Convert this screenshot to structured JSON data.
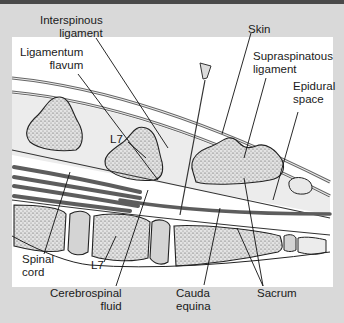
{
  "figure": {
    "type": "anatomical-diagram",
    "colors": {
      "background": "#d9d9d9",
      "panel": "#ffffff",
      "top_bar": "#4a4a4a",
      "bone_fill": "#e6e6e6",
      "bone_stipple": "#555555",
      "disc_fill": "#d4d4d4",
      "skin_band": "#eeeeee",
      "neural_line": "#5a5a5a",
      "leader_line": "#1a1a1a"
    }
  },
  "labels": {
    "interspinous_ligament": {
      "line1": "Interspinous",
      "line2": "ligament"
    },
    "ligamentum_flavum": {
      "line1": "Ligamentum",
      "line2": "flavum"
    },
    "skin": {
      "line1": "Skin"
    },
    "supraspinatous_ligament": {
      "line1": "Supraspinatous",
      "line2": "ligament"
    },
    "epidural_space": {
      "line1": "Epidural",
      "line2": "space"
    },
    "l7_upper": {
      "line1": "L7"
    },
    "l7_lower": {
      "line1": "L7"
    },
    "spinal_cord": {
      "line1": "Spinal",
      "line2": "cord"
    },
    "cerebrospinal_fluid": {
      "line1": "Cerebrospinal",
      "line2": "fluid"
    },
    "cauda_equina": {
      "line1": "Cauda",
      "line2": "equina"
    },
    "sacrum": {
      "line1": "Sacrum"
    }
  }
}
